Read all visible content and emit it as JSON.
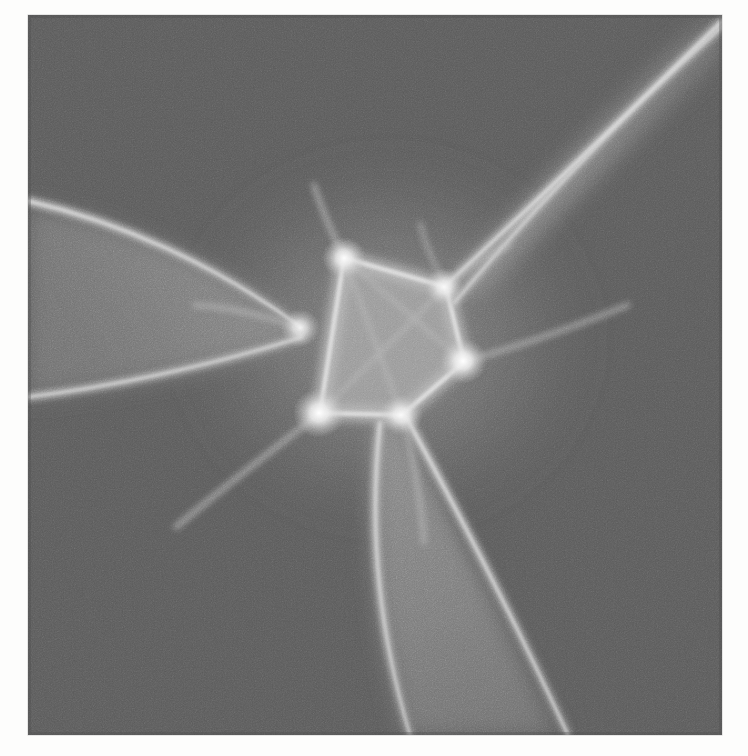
{
  "page": {
    "background_color": "#fdfdfc",
    "scan_note": "grayscale photographic plate on white page"
  },
  "plate": {
    "name": "caustic-photograph",
    "x": 28,
    "y": 15,
    "width": 694,
    "height": 720,
    "background_color": "#5b5b5b",
    "border_color": "#6a6a6a",
    "caption": ""
  },
  "ghost_text": {
    "line1": "",
    "line2": ""
  },
  "chart_data": {
    "type": "scatter",
    "title": "",
    "subtitle": "",
    "xlabel": "",
    "ylabel": "",
    "grid": false,
    "legend_position": "none",
    "xlim": [
      0,
      694
    ],
    "ylim": [
      0,
      720
    ],
    "colors": {
      "background": "#5b5b5b",
      "mid_gray": "#727272",
      "lobe_fill": "#7c7c7c",
      "core_fill": "#9c9c9c",
      "fold_line": "#c9c9c9",
      "cusp_hot": "#f2f2f2"
    },
    "noise": {
      "type": "film-grain",
      "amplitude": 0.16,
      "scale": 0.9
    },
    "core_polygon": {
      "label": "pentagon-core",
      "fill": "#9c9c9c",
      "vertices": [
        [
          316,
          243
        ],
        [
          418,
          272
        ],
        [
          436,
          347
        ],
        [
          374,
          400
        ],
        [
          292,
          398
        ]
      ]
    },
    "cusp_points": [
      {
        "id": "cusp-top-left",
        "x": 316,
        "y": 243,
        "intensity": 0.96,
        "radius": 11
      },
      {
        "id": "cusp-upper-right",
        "x": 416,
        "y": 272,
        "intensity": 0.88,
        "radius": 10
      },
      {
        "id": "cusp-right",
        "x": 435,
        "y": 346,
        "intensity": 1.0,
        "radius": 12
      },
      {
        "id": "cusp-bottom",
        "x": 373,
        "y": 400,
        "intensity": 0.9,
        "radius": 11
      },
      {
        "id": "cusp-bottom-left",
        "x": 291,
        "y": 398,
        "intensity": 1.0,
        "radius": 13
      },
      {
        "id": "cusp-left",
        "x": 272,
        "y": 313,
        "intensity": 0.82,
        "radius": 10
      }
    ],
    "lobes": [
      {
        "id": "lobe-upper-right",
        "fill": "#787878",
        "outer_arc": [
          [
            416,
            272
          ],
          [
            520,
            180
          ],
          [
            620,
            80
          ],
          [
            672,
            20
          ]
        ],
        "inner_arc": [
          [
            416,
            272
          ],
          [
            470,
            210
          ],
          [
            556,
            120
          ],
          [
            640,
            35
          ]
        ],
        "tip": [
          668,
          18
        ]
      },
      {
        "id": "lobe-left",
        "fill": "#787878",
        "outer_arc": [
          [
            272,
            313
          ],
          [
            190,
            250
          ],
          [
            90,
            205
          ],
          [
            6,
            190
          ]
        ],
        "inner_arc": [
          [
            272,
            313
          ],
          [
            180,
            350
          ],
          [
            80,
            372
          ],
          [
            4,
            378
          ]
        ],
        "tip": [
          2,
          200
        ]
      },
      {
        "id": "lobe-bottom",
        "fill": "#7a7a7a",
        "outer_arc": [
          [
            373,
            400
          ],
          [
            420,
            500
          ],
          [
            470,
            600
          ],
          [
            520,
            700
          ]
        ],
        "inner_arc": [
          [
            352,
            410
          ],
          [
            345,
            520
          ],
          [
            360,
            620
          ],
          [
            392,
            718
          ]
        ],
        "tip": [
          528,
          716
        ]
      }
    ],
    "fold_lines": [
      {
        "id": "fold-ur-outer",
        "points": [
          [
            416,
            272
          ],
          [
            520,
            176
          ],
          [
            630,
            68
          ],
          [
            686,
            12
          ]
        ]
      },
      {
        "id": "fold-ur-inner",
        "points": [
          [
            424,
            286
          ],
          [
            486,
            212
          ],
          [
            580,
            110
          ],
          [
            660,
            24
          ]
        ]
      },
      {
        "id": "fold-l-upper",
        "points": [
          [
            272,
            313
          ],
          [
            186,
            248
          ],
          [
            88,
            206
          ],
          [
            0,
            188
          ]
        ]
      },
      {
        "id": "fold-l-lower",
        "points": [
          [
            272,
            322
          ],
          [
            180,
            352
          ],
          [
            80,
            372
          ],
          [
            0,
            380
          ]
        ]
      },
      {
        "id": "fold-b-left",
        "points": [
          [
            352,
            408
          ],
          [
            340,
            520
          ],
          [
            352,
            620
          ],
          [
            382,
            720
          ]
        ]
      },
      {
        "id": "fold-b-right",
        "points": [
          [
            378,
            402
          ],
          [
            432,
            500
          ],
          [
            486,
            604
          ],
          [
            540,
            720
          ]
        ]
      },
      {
        "id": "fold-spur-tl",
        "points": [
          [
            316,
            243
          ],
          [
            298,
            214
          ],
          [
            286,
            186
          ]
        ]
      },
      {
        "id": "fold-spur-br",
        "points": [
          [
            435,
            346
          ],
          [
            492,
            330
          ],
          [
            556,
            306
          ]
        ]
      },
      {
        "id": "fold-spur-bl",
        "points": [
          [
            291,
            398
          ],
          [
            236,
            438
          ],
          [
            182,
            478
          ]
        ]
      },
      {
        "id": "fold-spur-b2",
        "points": [
          [
            373,
            400
          ],
          [
            386,
            452
          ],
          [
            392,
            500
          ]
        ]
      }
    ]
  }
}
